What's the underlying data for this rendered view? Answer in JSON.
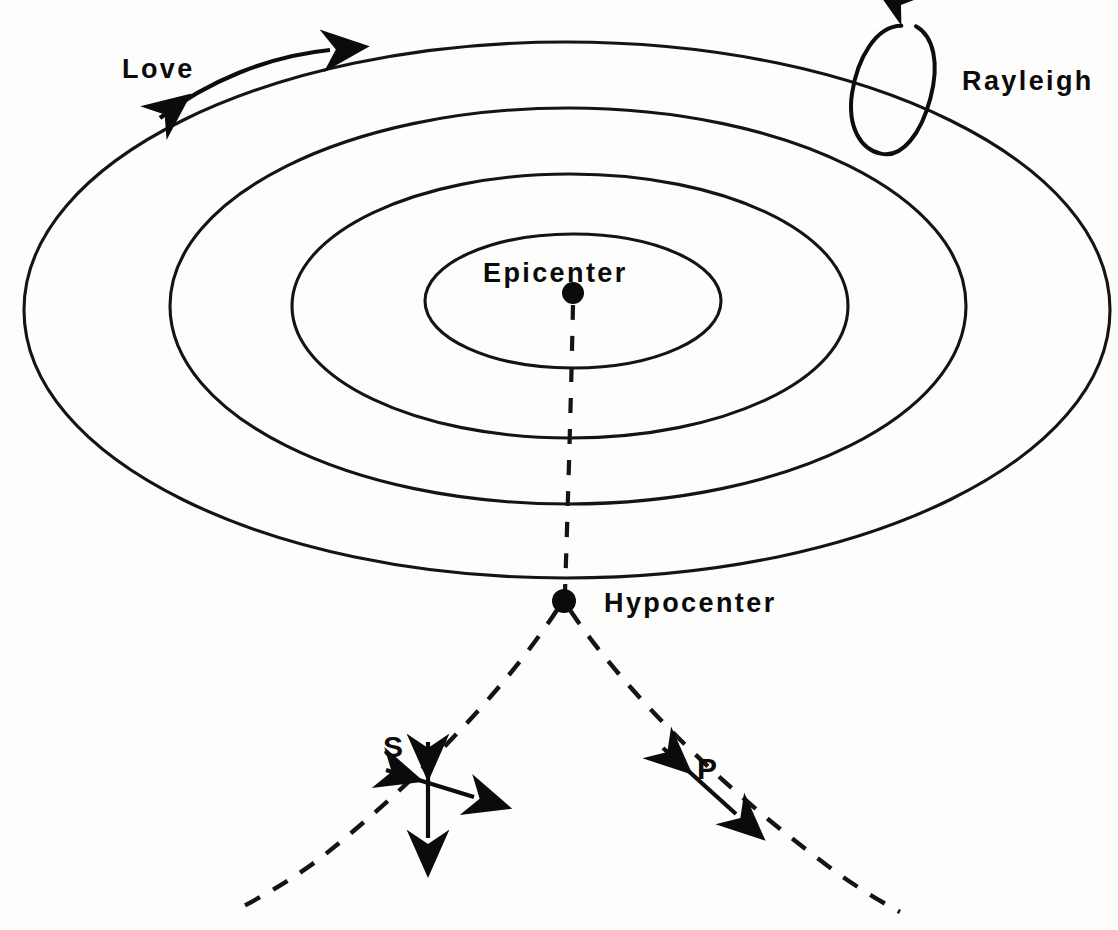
{
  "figure": {
    "kind": "seismic-wave-propagation-diagram",
    "background_color": "#fdfdfb",
    "ink_color": "#0b0b0b",
    "width": 1118,
    "height": 930
  },
  "labels": {
    "love": "Love",
    "rayleigh": "Rayleigh",
    "epicenter": "Epicenter",
    "hypocenter": "Hypocenter",
    "s_wave": "S",
    "p_wave": "P"
  },
  "markers": {
    "epicenter": {
      "x": 573,
      "y": 293,
      "r": 11
    },
    "hypocenter": {
      "x": 564,
      "y": 601,
      "r": 12
    }
  },
  "wavefronts": {
    "description": "Concentric elliptical surface wavefronts radiating from the epicenter",
    "count": 4,
    "ellipses": [
      {
        "index": 1,
        "cx": 573,
        "cy": 301,
        "rx": 148,
        "ry": 67
      },
      {
        "index": 2,
        "cx": 570,
        "cy": 306,
        "rx": 278,
        "ry": 132
      },
      {
        "index": 3,
        "cx": 568,
        "cy": 306,
        "rx": 398,
        "ry": 198
      },
      {
        "index": 4,
        "cx": 566,
        "cy": 310,
        "rx": 542,
        "ry": 268
      }
    ]
  },
  "rays": {
    "vertical_axis": {
      "from": [
        573,
        305
      ],
      "to": [
        564,
        592
      ],
      "style": "dashed"
    },
    "p_ray": {
      "side": "right",
      "from": [
        566,
        607
      ],
      "to": [
        900,
        912
      ],
      "style": "dashed"
    },
    "s_ray": {
      "side": "left",
      "from": [
        558,
        607
      ],
      "to": [
        232,
        912
      ],
      "style": "dashed"
    }
  },
  "annotations": {
    "love_arrow": {
      "type": "double-headed-curved-arrow",
      "meaning": "horizontal transverse shearing motion of Love surface wave",
      "from": [
        152,
        122
      ],
      "to": [
        338,
        50
      ]
    },
    "rayleigh_arrow": {
      "type": "elliptical-loop-arrow",
      "meaning": "retrograde elliptical particle motion of Rayleigh surface wave",
      "cx": 893,
      "cy": 82,
      "rx": 35,
      "ry": 68,
      "rotation_deg": 18
    },
    "s_arrow": {
      "type": "double-headed-cross-arrows",
      "meaning": "S wave particle motion perpendicular to ray path",
      "vertical": {
        "from": [
          428,
          732
        ],
        "to": [
          428,
          846
        ]
      },
      "transverse": {
        "from": [
          377,
          768
        ],
        "to": [
          482,
          800
        ]
      }
    },
    "p_arrow": {
      "type": "double-headed-arrow",
      "meaning": "P wave compressional motion along ray path",
      "from": [
        655,
        740
      ],
      "to": [
        744,
        822
      ]
    }
  },
  "label_positions": {
    "love": {
      "x": 122,
      "y": 78
    },
    "rayleigh": {
      "x": 962,
      "y": 90
    },
    "epicenter": {
      "x": 483,
      "y": 282
    },
    "hypocenter": {
      "x": 604,
      "y": 612
    },
    "s_wave": {
      "x": 383,
      "y": 757
    },
    "p_wave": {
      "x": 697,
      "y": 779
    }
  }
}
